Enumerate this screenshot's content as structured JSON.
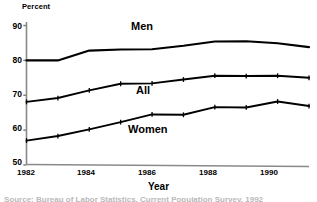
{
  "chart_data": {
    "type": "line",
    "title": "",
    "xlabel": "Year",
    "ylabel": "Percent",
    "ylabel_display": "Percent",
    "xlim": [
      1982,
      1991
    ],
    "ylim": [
      50,
      90
    ],
    "yticks": [
      50,
      60,
      70,
      80,
      90
    ],
    "xticks": [
      1982,
      1984,
      1986,
      1988,
      1990
    ],
    "x": [
      1982,
      1983,
      1984,
      1985,
      1986,
      1987,
      1988,
      1989,
      1990,
      1991
    ],
    "grid": false,
    "legend_position": "inline-annotations",
    "series": [
      {
        "name": "Men",
        "label": "Men",
        "color": "#000000",
        "values": [
          80.0,
          80.0,
          82.8,
          83.1,
          83.2,
          84.2,
          85.4,
          85.5,
          84.9,
          83.8
        ]
      },
      {
        "name": "All",
        "label": "All",
        "color": "#000000",
        "values": [
          68.1,
          69.2,
          71.4,
          73.3,
          73.4,
          74.5,
          75.6,
          75.5,
          75.6,
          75.0
        ]
      },
      {
        "name": "Women",
        "label": "Women",
        "color": "#000000",
        "values": [
          57.0,
          58.3,
          60.2,
          62.3,
          64.5,
          64.4,
          66.6,
          66.5,
          68.2,
          66.9
        ]
      }
    ],
    "annotations": [
      {
        "text": "Men",
        "x": 1986.0,
        "y": 88.3
      },
      {
        "text": "All",
        "x": 1986.0,
        "y": 70.5
      },
      {
        "text": "Women",
        "x": 1986.0,
        "y": 60.2
      }
    ]
  },
  "axes": {
    "ylabel": "Percent",
    "xlabel": "Year",
    "ytick_labels": [
      "90",
      "80",
      "70",
      "60",
      "50"
    ],
    "xtick_labels": [
      "1982",
      "1984",
      "1986",
      "1988",
      "1990"
    ]
  },
  "caption": {
    "partial_text": "Source: Bureau of Labor Statistics, Current Population Survey, 1992"
  },
  "colors": {
    "line": "#000000",
    "axis": "#808080",
    "background": "#ffffff",
    "caption": "#b9b9b9"
  }
}
